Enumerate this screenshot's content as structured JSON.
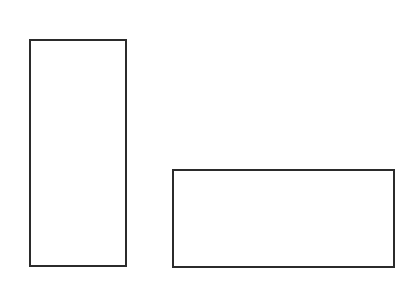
{
  "diagram": {
    "background": "#ffffff",
    "stroke_color": "#2b2b2b",
    "stroke_width": 2,
    "shapes": [
      {
        "name": "tall-rectangle",
        "type": "rect",
        "x": 30,
        "y": 40,
        "width": 96,
        "height": 226
      },
      {
        "name": "wide-rectangle",
        "type": "rect",
        "x": 173,
        "y": 170,
        "width": 221,
        "height": 97
      }
    ]
  }
}
